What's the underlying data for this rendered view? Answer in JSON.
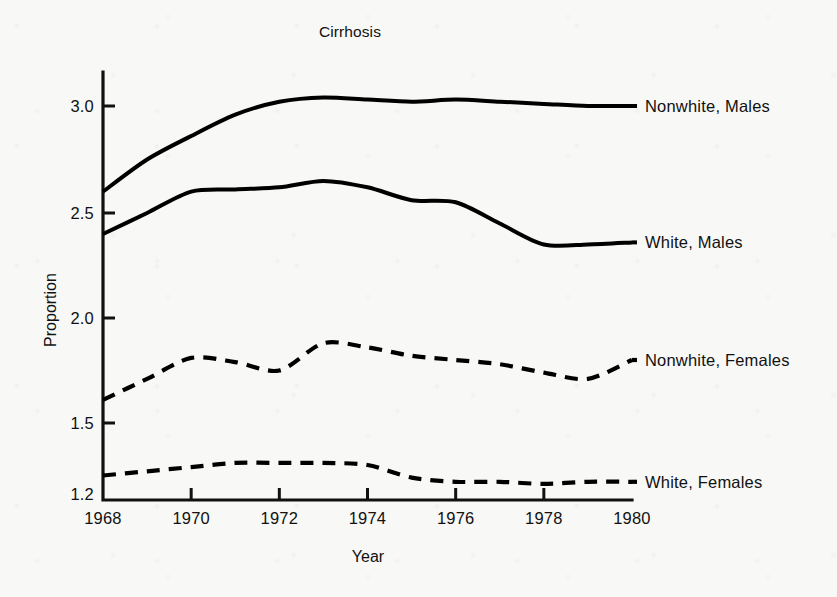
{
  "chart_data": {
    "type": "line",
    "title": "Cirrhosis",
    "xlabel": "Year",
    "ylabel": "Proportion",
    "xlim": [
      1968,
      1980
    ],
    "ylim": [
      1.2,
      3.1
    ],
    "grid": false,
    "legend_position": "right-of-plot-inline-labels",
    "x_ticks": [
      "1968",
      "1970",
      "1972",
      "1974",
      "1976",
      "1978",
      "1980"
    ],
    "x_tick_values": [
      1968,
      1970,
      1972,
      1974,
      1976,
      1978,
      1980
    ],
    "y_ticks": [
      "1.2",
      "1.5",
      "2.0",
      "2.5",
      "3.0"
    ],
    "y_tick_values": [
      1.2,
      1.5,
      2.0,
      2.5,
      3.0
    ],
    "x": [
      1968,
      1969,
      1970,
      1971,
      1972,
      1973,
      1974,
      1975,
      1976,
      1977,
      1978,
      1979,
      1980
    ],
    "series": [
      {
        "name": "Nonwhite, Males",
        "style": "solid",
        "color": "#000000",
        "values": [
          2.6,
          2.75,
          2.86,
          2.96,
          3.02,
          3.04,
          3.03,
          3.02,
          3.03,
          3.02,
          3.01,
          3.0,
          3.0
        ]
      },
      {
        "name": "White, Males",
        "style": "solid",
        "color": "#000000",
        "values": [
          2.4,
          2.5,
          2.6,
          2.61,
          2.62,
          2.65,
          2.62,
          2.56,
          2.55,
          2.45,
          2.35,
          2.35,
          2.36
        ]
      },
      {
        "name": "Nonwhite, Females",
        "style": "dashed",
        "color": "#000000",
        "values": [
          1.61,
          1.71,
          1.81,
          1.79,
          1.75,
          1.88,
          1.86,
          1.82,
          1.8,
          1.78,
          1.74,
          1.71,
          1.8
        ]
      },
      {
        "name": "White, Females",
        "style": "dashed",
        "color": "#000000",
        "values": [
          1.25,
          1.27,
          1.29,
          1.31,
          1.31,
          1.31,
          1.3,
          1.24,
          1.22,
          1.22,
          1.21,
          1.22,
          1.22
        ]
      }
    ],
    "series_labels": [
      {
        "text": "Nonwhite, Males",
        "at_year": 1980,
        "at_value": 3.0
      },
      {
        "text": "White, Males",
        "at_year": 1980,
        "at_value": 2.36
      },
      {
        "text": "Nonwhite, Females",
        "at_year": 1980,
        "at_value": 1.8
      },
      {
        "text": "White, Females",
        "at_year": 1980,
        "at_value": 1.22
      }
    ]
  }
}
